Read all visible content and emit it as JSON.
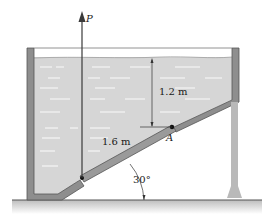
{
  "figure": {
    "type": "tank-with-inclined-gate",
    "labels": {
      "force": "P",
      "depth": "1.2 m",
      "gate_length": "1.6 m",
      "hinge": "A",
      "angle": "30°"
    }
  },
  "colors": {
    "water": "#d4d4d4",
    "wall": "#8c8c8c",
    "wall_edge": "#555555",
    "ground": "#cfcfcf",
    "arrow": "#3a3a3a",
    "dash": "#f4f4f4"
  }
}
